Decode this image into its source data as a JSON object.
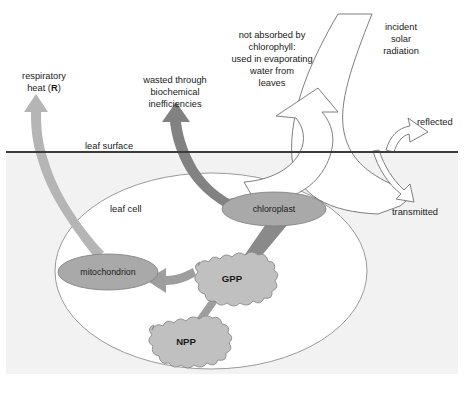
{
  "diagram": {
    "background_color": "#ffffff",
    "below_surface_color": "#f2f2f2",
    "leaf_surface_line_color": "#3c3c3c",
    "outline_color": "#9a9a9a",
    "organelle_fill": "#a9a9a9",
    "box_fill": "#c0c0c0",
    "arrow_dark": "#828282",
    "arrow_mid": "#9e9e9e",
    "arrow_light": "#b5b5b5",
    "white_arrow_fill": "#ffffff",
    "white_arrow_stroke": "#6f6f6f"
  },
  "labels": {
    "respiratory_heat_line1": "respiratory",
    "respiratory_heat_line2_plain": "heat (",
    "respiratory_heat_symbol": "R",
    "respiratory_heat_line2_close": ")",
    "wasted_line1": "wasted through",
    "wasted_line2": "biochemical",
    "wasted_line3": "inefficiencies",
    "not_absorbed_line1": "not absorbed by",
    "not_absorbed_line2": "chlorophyll:",
    "not_absorbed_line3": "used in evaporating",
    "not_absorbed_line4": "water from",
    "not_absorbed_line5": "leaves",
    "incident_line1": "incident",
    "incident_line2": "solar",
    "incident_line3": "radiation",
    "reflected": "reflected",
    "transmitted": "transmitted",
    "leaf_surface": "leaf surface",
    "leaf_cell": "leaf cell"
  },
  "nodes": [
    {
      "id": "chloroplast",
      "label": "chloroplast",
      "shape": "ellipse",
      "cx": 274,
      "cy": 209,
      "rx": 52,
      "ry": 17
    },
    {
      "id": "mitochondrion",
      "label": "mitochondrion",
      "shape": "ellipse",
      "cx": 108,
      "cy": 272,
      "rx": 50,
      "ry": 18
    },
    {
      "id": "gpp",
      "label": "GPP",
      "shape": "cloud-box",
      "cx": 231,
      "cy": 278,
      "w": 72,
      "h": 32
    },
    {
      "id": "npp",
      "label": "NPP",
      "shape": "cloud-box",
      "cx": 185,
      "cy": 341,
      "w": 72,
      "h": 30
    }
  ],
  "flows": [
    {
      "id": "solar-in",
      "from": "incident solar radiation",
      "to": "chloroplast",
      "style": "white-outline-arrow"
    },
    {
      "id": "not-absorbed",
      "from": "leaf",
      "to": "not absorbed by chlorophyll",
      "style": "white-outline-arrow"
    },
    {
      "id": "reflected",
      "from": "leaf surface",
      "to": "reflected",
      "style": "white-outline-arrow"
    },
    {
      "id": "transmitted",
      "from": "leaf surface",
      "to": "transmitted",
      "style": "white-outline-arrow"
    },
    {
      "id": "wasted",
      "from": "chloroplast",
      "to": "wasted through biochemical inefficiencies",
      "style": "grey-arrow-dark"
    },
    {
      "id": "chloroplast-gpp",
      "from": "chloroplast",
      "to": "GPP",
      "style": "grey-arrow-dark"
    },
    {
      "id": "gpp-mitochondrion",
      "from": "GPP",
      "to": "mitochondrion",
      "style": "grey-arrow-mid"
    },
    {
      "id": "gpp-npp",
      "from": "GPP",
      "to": "NPP",
      "style": "grey-arrow-mid"
    },
    {
      "id": "mitochondrion-respiratory",
      "from": "mitochondrion",
      "to": "respiratory heat (R)",
      "style": "grey-arrow-light"
    }
  ],
  "geometry": {
    "leaf_surface_y": 152,
    "leaf_surface_x1": 6,
    "leaf_surface_x2": 458,
    "shaded_top": 152,
    "shaded_bottom": 374,
    "shaded_left": 6,
    "shaded_right": 458,
    "leaf_cell_cx": 211,
    "leaf_cell_cy": 271,
    "leaf_cell_rx": 156,
    "leaf_cell_ry": 98
  }
}
